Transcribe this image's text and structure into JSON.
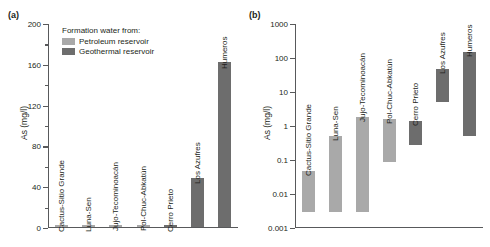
{
  "figure": {
    "panel_a_tag": "(a)",
    "panel_b_tag": "(b)"
  },
  "legend": {
    "title": "Formation water from:",
    "items": [
      {
        "label": "Petroleum reservoir",
        "color": "#a9a9a9"
      },
      {
        "label": "Geothermal reservoir",
        "color": "#6d6d6d"
      }
    ]
  },
  "colors": {
    "petroleum": "#a9a9a9",
    "geothermal": "#6d6d6d",
    "axis": "#58595b",
    "text": "#231f20"
  },
  "chart_data": [
    {
      "type": "bar",
      "title": "(a)",
      "xlabel": "",
      "ylabel": "As (mg/l)",
      "yscale": "linear",
      "ylim": [
        0,
        200
      ],
      "yticks": [
        0,
        40,
        80,
        120,
        160,
        200
      ],
      "ytick_labels": [
        "0",
        "40",
        "80",
        "120",
        "160",
        "200"
      ],
      "grid": false,
      "legend_position": "upper-left",
      "categories": [
        "Cactus-Sitio Grande",
        "Luna-Sen",
        "Jujo-Tecominoacán",
        "Pol-Chuc-Abkatún",
        "Cerro Prieto",
        "Los Azufres",
        "Humeros"
      ],
      "values": [
        0.05,
        0.5,
        1.8,
        1.5,
        1.4,
        48,
        161
      ],
      "series": [
        {
          "name": "Petroleum reservoir",
          "values": [
            0.05,
            0.5,
            1.8,
            1.5,
            null,
            null,
            null
          ]
        },
        {
          "name": "Geothermal reservoir",
          "values": [
            null,
            null,
            null,
            null,
            1.4,
            48,
            161
          ]
        }
      ]
    },
    {
      "type": "bar",
      "title": "(b)",
      "xlabel": "",
      "ylabel": "As (mg/l)",
      "yscale": "log",
      "ylim": [
        0.001,
        1000
      ],
      "yticks": [
        0.001,
        0.01,
        0.1,
        1,
        10,
        100,
        1000
      ],
      "ytick_labels": [
        "0.001",
        "0.01",
        "0.1",
        "1",
        "10",
        "100",
        "1000"
      ],
      "grid": false,
      "legend_position": "none",
      "bar_style": "range",
      "categories": [
        "Cactus-Sitio Grande",
        "Luna-Sen",
        "Jujo-Tecominoacán",
        "Pol-Chuc-Abkatún",
        "Cerro Prieto",
        "Los Azufres",
        "Humeros"
      ],
      "ranges": [
        {
          "label": "Cactus-Sitio Grande",
          "min": 0.003,
          "max": 0.047,
          "group": "Petroleum reservoir"
        },
        {
          "label": "Luna-Sen",
          "min": 0.003,
          "max": 0.52,
          "group": "Petroleum reservoir"
        },
        {
          "label": "Jujo-Tecominoacán",
          "min": 0.003,
          "max": 1.8,
          "group": "Petroleum reservoir"
        },
        {
          "label": "Pol-Chuc-Abkatún",
          "min": 0.09,
          "max": 1.6,
          "group": "Petroleum reservoir"
        },
        {
          "label": "Cerro Prieto",
          "min": 0.27,
          "max": 1.4,
          "group": "Geothermal reservoir"
        },
        {
          "label": "Los Azufres",
          "min": 5.2,
          "max": 47,
          "group": "Geothermal reservoir"
        },
        {
          "label": "Humeros",
          "min": 0.5,
          "max": 155,
          "group": "Geothermal reservoir"
        }
      ]
    }
  ]
}
